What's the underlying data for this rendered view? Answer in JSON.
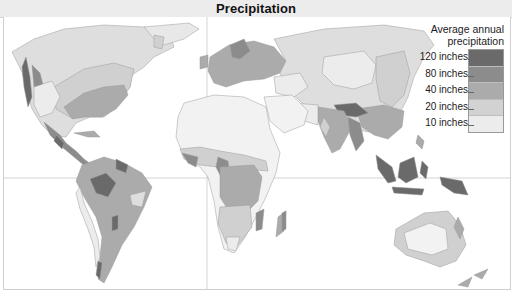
{
  "header": {
    "title": "Precipitation"
  },
  "legend": {
    "title_line1": "Average annual",
    "title_line2": "precipitation",
    "levels": [
      {
        "label": "120 inches",
        "color": "#6a6a6a"
      },
      {
        "label": "80 inches",
        "color": "#8c8c8c"
      },
      {
        "label": "40 inches",
        "color": "#ababab"
      },
      {
        "label": "20 inches",
        "color": "#d2d2d2"
      },
      {
        "label": "10 inches",
        "color": "#ececec"
      }
    ],
    "lowest_color": "#e2e2e2"
  },
  "map": {
    "type": "world-choropleth",
    "variable": "Average annual precipitation",
    "units": "inches",
    "gridlines": {
      "equator": true,
      "prime_meridian": true
    },
    "regions": [
      {
        "name": "Pacific Northwest coast",
        "level": "120 inches"
      },
      {
        "name": "Eastern United States",
        "level": "40 inches"
      },
      {
        "name": "Western United States / Canada interior",
        "level": "10 inches"
      },
      {
        "name": "Central America",
        "level": "80 inches"
      },
      {
        "name": "Amazon Basin",
        "level": "80 inches"
      },
      {
        "name": "Western Amazon core",
        "level": "120 inches"
      },
      {
        "name": "Northeast Brazil",
        "level": "20 inches"
      },
      {
        "name": "Atacama / Peru coast",
        "level": "10 inches"
      },
      {
        "name": "Southern Chile",
        "level": "120 inches"
      },
      {
        "name": "Sahara",
        "level": "below 10 inches"
      },
      {
        "name": "Gulf of Guinea coast",
        "level": "80 inches"
      },
      {
        "name": "Congo Basin",
        "level": "40 inches"
      },
      {
        "name": "Southern Africa",
        "level": "20 inches"
      },
      {
        "name": "Eastern Madagascar",
        "level": "80 inches"
      },
      {
        "name": "Western Europe",
        "level": "40 inches"
      },
      {
        "name": "Siberia / Russia",
        "level": "20 inches"
      },
      {
        "name": "Central Asia / Gobi",
        "level": "10 inches"
      },
      {
        "name": "Arabian Peninsula",
        "level": "below 10 inches"
      },
      {
        "name": "India",
        "level": "40 inches"
      },
      {
        "name": "Himalayan foothills / Bangladesh / Burma",
        "level": "120 inches"
      },
      {
        "name": "Southeast China",
        "level": "40 inches"
      },
      {
        "name": "Indonesia / New Guinea",
        "level": "120 inches"
      },
      {
        "name": "Australian interior",
        "level": "below 10 inches"
      },
      {
        "name": "Eastern Australia",
        "level": "20 inches"
      },
      {
        "name": "New Zealand",
        "level": "40 inches"
      }
    ]
  }
}
